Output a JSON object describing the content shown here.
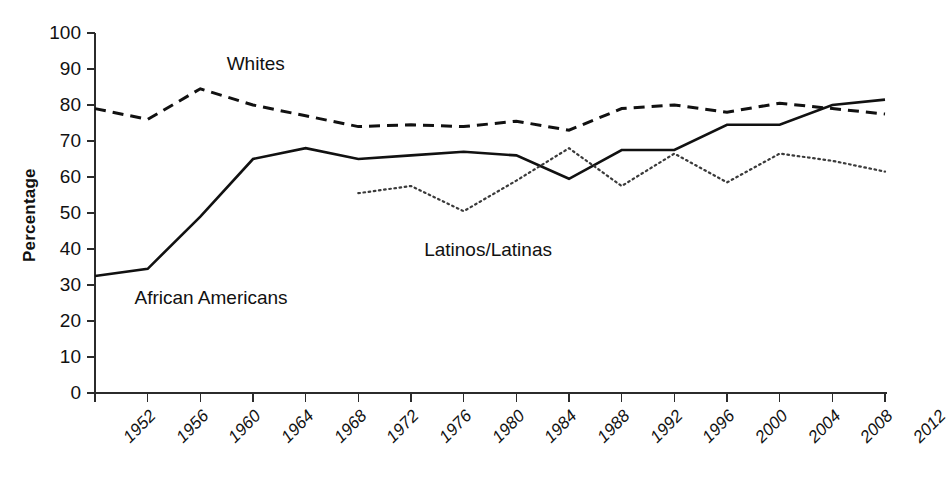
{
  "chart_data": {
    "type": "line",
    "title": "",
    "xlabel": "",
    "ylabel": "Percentage",
    "xlim": [
      1952,
      2012
    ],
    "ylim": [
      0,
      100
    ],
    "grid": false,
    "legend_position": "inline-annotations",
    "categories": [
      1952,
      1956,
      1960,
      1964,
      1968,
      1972,
      1976,
      1980,
      1984,
      1988,
      1992,
      1996,
      2000,
      2004,
      2008,
      2012
    ],
    "x_tick_labels": [
      "1952",
      "1956",
      "1960",
      "1964",
      "1968",
      "1972",
      "1976",
      "1980",
      "1984",
      "1988",
      "1992",
      "1996",
      "2000",
      "2004",
      "2008",
      "2012"
    ],
    "y_tick_labels": [
      "0",
      "10",
      "20",
      "30",
      "40",
      "50",
      "60",
      "70",
      "80",
      "90",
      "100"
    ],
    "y_ticks": [
      0,
      10,
      20,
      30,
      40,
      50,
      60,
      70,
      80,
      90,
      100
    ],
    "series": [
      {
        "name": "Whites",
        "style": "dashed",
        "color": "#111111",
        "x": [
          1952,
          1956,
          1960,
          1964,
          1968,
          1972,
          1976,
          1980,
          1984,
          1988,
          1992,
          1996,
          2000,
          2004,
          2008,
          2012
        ],
        "values": [
          79,
          76,
          84.5,
          80,
          77,
          74,
          74.5,
          74,
          75.5,
          73,
          79,
          80,
          78,
          80.5,
          79,
          77.5
        ]
      },
      {
        "name": "African Americans",
        "style": "solid",
        "color": "#111111",
        "x": [
          1952,
          1956,
          1960,
          1964,
          1968,
          1972,
          1976,
          1980,
          1984,
          1988,
          1992,
          1996,
          2000,
          2004,
          2008,
          2012
        ],
        "values": [
          32.5,
          34.5,
          49,
          65,
          68,
          65,
          66,
          67,
          66,
          59.5,
          67.5,
          67.5,
          74.5,
          74.5,
          80,
          81.5
        ]
      },
      {
        "name": "Latinos/Latinas",
        "style": "dotted",
        "color": "#3a3a3a",
        "x": [
          1972,
          1976,
          1980,
          1984,
          1988,
          1992,
          1996,
          2000,
          2004,
          2008,
          2012
        ],
        "values": [
          55.5,
          57.5,
          50.5,
          59,
          68,
          57.5,
          66.5,
          58.5,
          66.5,
          64.5,
          61.5
        ]
      }
    ],
    "annotations": [
      {
        "text": "Whites",
        "x_year": 1962,
        "y_value": 91
      },
      {
        "text": "Latinos/Latinas",
        "x_year": 1977,
        "y_value": 39.5
      },
      {
        "text": "African Americans",
        "x_year": 1955,
        "y_value": 26
      }
    ]
  }
}
